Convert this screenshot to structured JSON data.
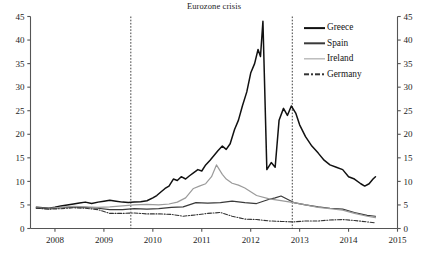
{
  "chart_data": {
    "type": "line",
    "title": "Eurozone crisis",
    "xlabel": "",
    "ylabel": "",
    "grid": false,
    "legend_position": "top-right",
    "xlim": [
      2007.5,
      2015.0
    ],
    "ylim": [
      0,
      45
    ],
    "xticks": [
      2008,
      2009,
      2010,
      2011,
      2012,
      2013,
      2014,
      2015
    ],
    "xtick_labels": [
      "2008",
      "2009",
      "2010",
      "2011",
      "2012",
      "2013",
      "2014",
      "2015"
    ],
    "yticks": [
      0,
      5,
      10,
      15,
      20,
      25,
      30,
      35,
      40,
      45
    ],
    "ytick_labels": [
      "0",
      "5",
      "10",
      "15",
      "20",
      "25",
      "30",
      "35",
      "40",
      "45"
    ],
    "right_axis_ticks": [
      0,
      5,
      10,
      15,
      20,
      25,
      30,
      35,
      40,
      45
    ],
    "right_axis_labels": [
      "0",
      "5",
      "10",
      "15",
      "20",
      "25",
      "30",
      "35",
      "40",
      "45"
    ],
    "annotations": [
      {
        "type": "vline",
        "x": 2009.55,
        "style": "dashed",
        "label": ""
      },
      {
        "type": "vline",
        "x": 2012.85,
        "style": "dashed",
        "label": ""
      }
    ],
    "series": [
      {
        "name": "Greece",
        "color": "#111111",
        "width": 1.5,
        "dash": "solid",
        "x": [
          2007.62,
          2007.75,
          2007.88,
          2008.0,
          2008.12,
          2008.25,
          2008.38,
          2008.5,
          2008.62,
          2008.75,
          2008.88,
          2009.0,
          2009.12,
          2009.25,
          2009.38,
          2009.5,
          2009.62,
          2009.75,
          2009.88,
          2010.0,
          2010.08,
          2010.17,
          2010.25,
          2010.33,
          2010.42,
          2010.5,
          2010.58,
          2010.67,
          2010.75,
          2010.83,
          2010.92,
          2011.0,
          2011.08,
          2011.17,
          2011.25,
          2011.33,
          2011.42,
          2011.5,
          2011.58,
          2011.67,
          2011.75,
          2011.83,
          2011.92,
          2012.0,
          2012.08,
          2012.15,
          2012.2,
          2012.25,
          2012.33,
          2012.42,
          2012.5,
          2012.58,
          2012.67,
          2012.75,
          2012.83,
          2012.92,
          2013.0,
          2013.12,
          2013.25,
          2013.38,
          2013.5,
          2013.62,
          2013.75,
          2013.88,
          2014.0,
          2014.12,
          2014.25,
          2014.33,
          2014.42,
          2014.5,
          2014.55
        ],
        "y": [
          4.5,
          4.4,
          4.3,
          4.5,
          4.8,
          5.0,
          5.2,
          5.4,
          5.6,
          5.3,
          5.6,
          5.8,
          6.0,
          5.8,
          5.6,
          5.5,
          5.6,
          5.7,
          5.9,
          6.5,
          7.0,
          7.8,
          8.5,
          9.0,
          10.5,
          10.2,
          11.0,
          10.5,
          11.2,
          11.8,
          12.5,
          12.2,
          13.5,
          14.5,
          15.5,
          16.5,
          17.5,
          16.8,
          18.0,
          21.0,
          23.0,
          26.0,
          29.0,
          33.0,
          35.0,
          38.0,
          36.5,
          44.0,
          12.5,
          14.0,
          13.0,
          23.0,
          25.5,
          24.0,
          26.0,
          24.5,
          22.0,
          19.5,
          17.5,
          16.0,
          14.5,
          13.5,
          13.0,
          12.5,
          11.0,
          10.5,
          9.5,
          9.0,
          9.5,
          10.5,
          11.0
        ]
      },
      {
        "name": "Spain",
        "color": "#3a3a3a",
        "width": 1.2,
        "dash": "solid",
        "x": [
          2007.62,
          2007.88,
          2008.12,
          2008.38,
          2008.62,
          2008.88,
          2009.12,
          2009.38,
          2009.62,
          2009.88,
          2010.12,
          2010.38,
          2010.62,
          2010.88,
          2011.12,
          2011.38,
          2011.62,
          2011.88,
          2012.12,
          2012.38,
          2012.5,
          2012.62,
          2012.88,
          2013.12,
          2013.38,
          2013.62,
          2013.88,
          2014.12,
          2014.38,
          2014.55
        ],
        "y": [
          4.3,
          4.2,
          4.4,
          4.6,
          4.5,
          4.3,
          4.0,
          4.0,
          4.2,
          4.1,
          4.2,
          4.5,
          4.6,
          5.5,
          5.4,
          5.5,
          5.8,
          5.5,
          5.3,
          6.2,
          6.5,
          6.9,
          5.5,
          5.0,
          4.6,
          4.3,
          4.1,
          3.4,
          2.8,
          2.6
        ]
      },
      {
        "name": "Ireland",
        "color": "#9b9b9b",
        "width": 1.2,
        "dash": "solid",
        "x": [
          2007.62,
          2007.88,
          2008.12,
          2008.38,
          2008.62,
          2008.88,
          2009.12,
          2009.38,
          2009.62,
          2009.88,
          2010.12,
          2010.33,
          2010.5,
          2010.67,
          2010.83,
          2010.95,
          2011.08,
          2011.2,
          2011.3,
          2011.42,
          2011.5,
          2011.62,
          2011.75,
          2011.88,
          2012.12,
          2012.38,
          2012.62,
          2012.88,
          2013.12,
          2013.38,
          2013.62,
          2013.88,
          2014.12,
          2014.38,
          2014.55
        ],
        "y": [
          4.4,
          4.3,
          4.5,
          4.7,
          4.6,
          4.5,
          4.6,
          4.8,
          5.0,
          5.1,
          5.0,
          5.2,
          5.6,
          6.5,
          8.5,
          9.0,
          9.5,
          11.0,
          13.5,
          11.5,
          10.5,
          9.6,
          9.2,
          8.6,
          7.0,
          6.3,
          5.9,
          5.5,
          5.0,
          4.5,
          4.2,
          3.9,
          3.2,
          2.6,
          2.3
        ]
      },
      {
        "name": "Germany",
        "color": "#333333",
        "width": 1.1,
        "dash": "dashdot",
        "x": [
          2007.62,
          2007.88,
          2008.12,
          2008.38,
          2008.62,
          2008.88,
          2009.12,
          2009.38,
          2009.62,
          2009.88,
          2010.12,
          2010.38,
          2010.62,
          2010.88,
          2011.12,
          2011.38,
          2011.62,
          2011.88,
          2012.12,
          2012.38,
          2012.62,
          2012.88,
          2013.12,
          2013.38,
          2013.62,
          2013.88,
          2014.12,
          2014.38,
          2014.55
        ],
        "y": [
          4.3,
          4.1,
          4.2,
          4.4,
          4.3,
          4.0,
          3.2,
          3.2,
          3.3,
          3.1,
          3.1,
          3.0,
          2.6,
          2.9,
          3.2,
          3.4,
          2.6,
          2.0,
          1.9,
          1.6,
          1.5,
          1.4,
          1.6,
          1.6,
          1.8,
          1.9,
          1.7,
          1.4,
          1.2
        ]
      }
    ]
  },
  "legend": {
    "items": [
      {
        "label": "Greece",
        "key": "line-solid-thick"
      },
      {
        "label": "Spain",
        "key": "line-solid-medium"
      },
      {
        "label": "Ireland",
        "key": "line-solid-light"
      },
      {
        "label": "Germany",
        "key": "line-dashdot"
      }
    ]
  }
}
